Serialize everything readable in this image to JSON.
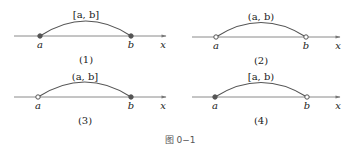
{
  "figure": {
    "caption": "图 0−1",
    "panels": [
      {
        "id": "1",
        "number_label": "(1)",
        "interval_label": "[a, b]",
        "left_label": "a",
        "right_label": "b",
        "axis_label": "x",
        "left_closed": true,
        "right_closed": true
      },
      {
        "id": "2",
        "number_label": "(2)",
        "interval_label": "(a, b)",
        "left_label": "a",
        "right_label": "b",
        "axis_label": "x",
        "left_closed": false,
        "right_closed": false
      },
      {
        "id": "3",
        "number_label": "(3)",
        "interval_label": "(a, b]",
        "left_label": "a",
        "right_label": "b",
        "axis_label": "x",
        "left_closed": false,
        "right_closed": true
      },
      {
        "id": "4",
        "number_label": "(4)",
        "interval_label": "[a, b)",
        "left_label": "a",
        "right_label": "b",
        "axis_label": "x",
        "left_closed": true,
        "right_closed": false
      }
    ]
  },
  "colors": {
    "axis": "#8a8a8a",
    "arc": "#555555",
    "point": "#555555"
  }
}
